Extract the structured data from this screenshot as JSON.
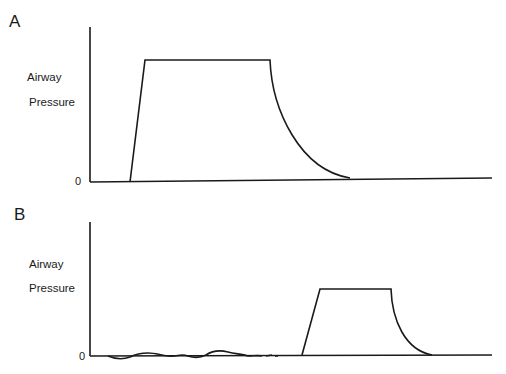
{
  "panels": [
    {
      "letter": "A",
      "ylabel_line1": "Airway",
      "ylabel_line2": "Pressure",
      "zero_label": "0",
      "description": "Square pressure waveform with exponential decay"
    },
    {
      "letter": "B",
      "ylabel_line1": "Airway",
      "ylabel_line2": "Pressure",
      "zero_label": "0",
      "description": "Small spontaneous breathing oscillations followed by a delayed, shorter pressure waveform"
    }
  ],
  "colors": {
    "line": "#1a1a1a",
    "background": "#ffffff"
  }
}
